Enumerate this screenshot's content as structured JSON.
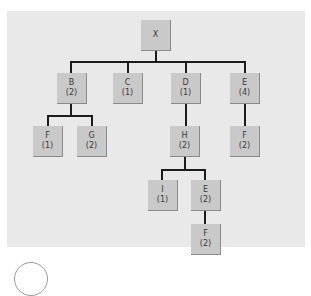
{
  "diagram": {
    "root": {
      "label": "X"
    },
    "nodes": [
      {
        "id": "X",
        "label": "X",
        "count": ""
      },
      {
        "id": "B",
        "label": "B",
        "count": "(2)"
      },
      {
        "id": "C",
        "label": "C",
        "count": "(1)"
      },
      {
        "id": "D",
        "label": "D",
        "count": "(1)"
      },
      {
        "id": "E",
        "label": "E",
        "count": "(4)"
      },
      {
        "id": "F_B",
        "label": "F",
        "count": "(1)"
      },
      {
        "id": "G",
        "label": "G",
        "count": "(2)"
      },
      {
        "id": "H",
        "label": "H",
        "count": "(2)"
      },
      {
        "id": "F_E",
        "label": "F",
        "count": "(2)"
      },
      {
        "id": "I",
        "label": "I",
        "count": "(1)"
      },
      {
        "id": "E_H",
        "label": "E",
        "count": "(2)"
      },
      {
        "id": "F_EH",
        "label": "F",
        "count": "(2)"
      }
    ],
    "edges": [
      [
        "X",
        "B"
      ],
      [
        "X",
        "C"
      ],
      [
        "X",
        "D"
      ],
      [
        "X",
        "E"
      ],
      [
        "B",
        "F_B"
      ],
      [
        "B",
        "G"
      ],
      [
        "D",
        "H"
      ],
      [
        "E",
        "F_E"
      ],
      [
        "H",
        "I"
      ],
      [
        "H",
        "E_H"
      ],
      [
        "E_H",
        "F_EH"
      ]
    ]
  }
}
